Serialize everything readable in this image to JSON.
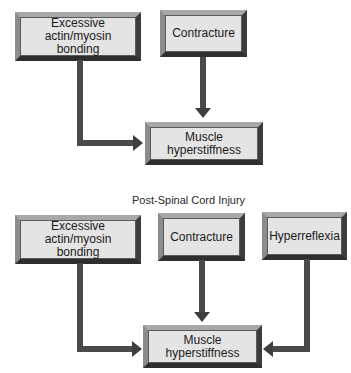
{
  "diagram_top": {
    "boxes": {
      "actin": "Excessive actin/myosin bonding",
      "contracture": "Contracture",
      "result": "Muscle hyperstiffness"
    }
  },
  "diagram_bottom": {
    "title": "Post-Spinal Cord Injury",
    "boxes": {
      "actin": "Excessive actin/myosin bonding",
      "contracture": "Contracture",
      "hyperreflexia": "Hyperreflexia",
      "result": "Muscle hyperstiffness"
    }
  },
  "colors": {
    "box_fill": "#e4e4e4",
    "arrow": "#4a4a4a",
    "bevel_light": "#a8a8a8",
    "bevel_dark": "#2e2e2e"
  }
}
